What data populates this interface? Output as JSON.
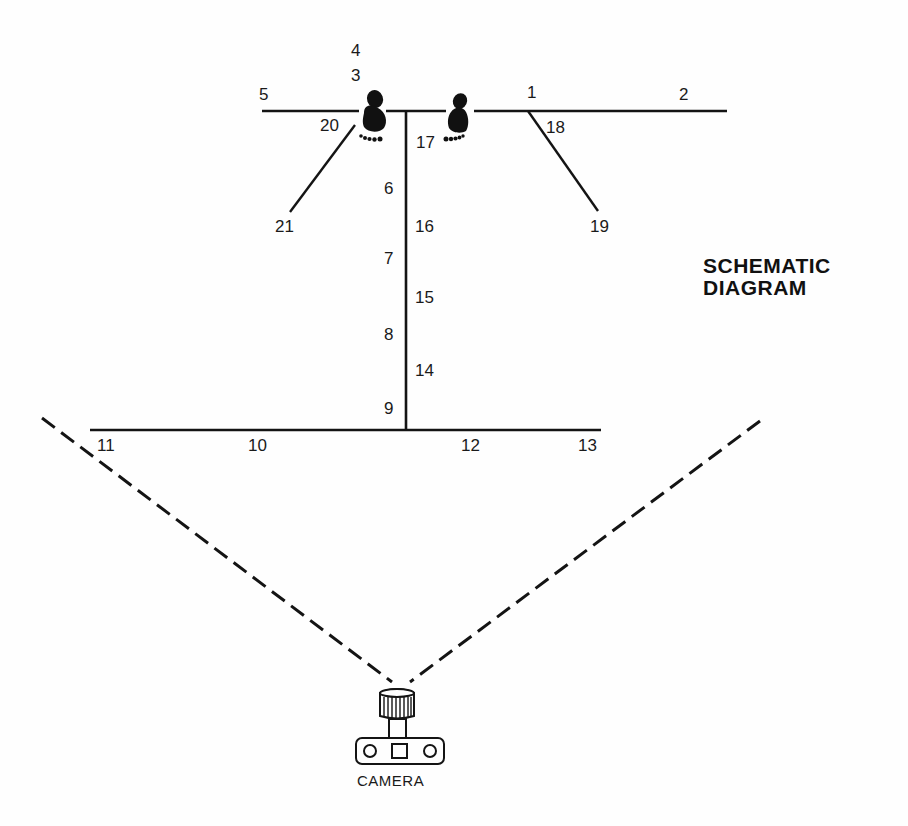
{
  "title": {
    "line1": "SCHEMATIC",
    "line2": "DIAGRAM"
  },
  "camera": {
    "label": "CAMERA",
    "icon": "camera-icon"
  },
  "icons": {
    "left_foot": "footprint-icon",
    "right_foot": "footprint-icon"
  },
  "positions": [
    {
      "id": "p1",
      "label": "1"
    },
    {
      "id": "p2",
      "label": "2"
    },
    {
      "id": "p3",
      "label": "3"
    },
    {
      "id": "p4",
      "label": "4"
    },
    {
      "id": "p5",
      "label": "5"
    },
    {
      "id": "p6",
      "label": "6"
    },
    {
      "id": "p7",
      "label": "7"
    },
    {
      "id": "p8",
      "label": "8"
    },
    {
      "id": "p9",
      "label": "9"
    },
    {
      "id": "p10",
      "label": "10"
    },
    {
      "id": "p11",
      "label": "11"
    },
    {
      "id": "p12",
      "label": "12"
    },
    {
      "id": "p13",
      "label": "13"
    },
    {
      "id": "p14",
      "label": "14"
    },
    {
      "id": "p15",
      "label": "15"
    },
    {
      "id": "p16",
      "label": "16"
    },
    {
      "id": "p17",
      "label": "17"
    },
    {
      "id": "p18",
      "label": "18"
    },
    {
      "id": "p19",
      "label": "19"
    },
    {
      "id": "p20",
      "label": "20"
    },
    {
      "id": "p21",
      "label": "21"
    }
  ],
  "colors": {
    "line": "#141414",
    "background": "#fefefe"
  }
}
